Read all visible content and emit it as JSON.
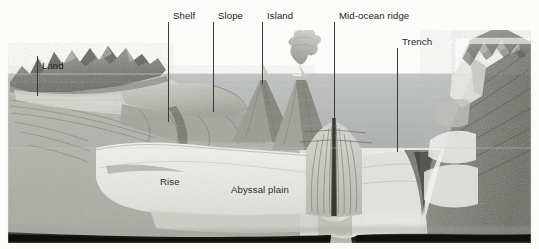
{
  "diagram": {
    "type": "geology-cross-section",
    "palette": {
      "background": "#fbfbfa",
      "water_upper": "#b9bcbb",
      "water_lower": "#e9eae6",
      "crust_light": "#cfd0cb",
      "crust_mid": "#a9aaa4",
      "crust_dark": "#6e6f69",
      "mantle_band": "#14130f",
      "label_text": "#232323",
      "leader_line": "#3a3a3a"
    },
    "callouts": [
      {
        "id": "land",
        "label": "Land",
        "label_x": 40,
        "label_y": 60,
        "line_x": 37,
        "line_y1": 56,
        "line_y2": 96
      },
      {
        "id": "shelf",
        "label": "Shelf",
        "label_x": 170,
        "label_y": 10,
        "line_x": 168,
        "line_y1": 22,
        "line_y2": 122
      },
      {
        "id": "slope",
        "label": "Slope",
        "label_x": 215,
        "label_y": 10,
        "line_x": 213,
        "line_y1": 22,
        "line_y2": 112
      },
      {
        "id": "island",
        "label": "Island",
        "label_x": 264,
        "label_y": 10,
        "line_x": 262,
        "line_y1": 22,
        "line_y2": 84
      },
      {
        "id": "mid-ocean-ridge",
        "label": "Mid-ocean ridge",
        "label_x": 336,
        "label_y": 10,
        "line_x": 334,
        "line_y1": 22,
        "line_y2": 134
      },
      {
        "id": "trench",
        "label": "Trench",
        "label_x": 399,
        "label_y": 36,
        "line_x": 397,
        "line_y1": 48,
        "line_y2": 152
      }
    ],
    "inline_labels": [
      {
        "id": "rise",
        "label": "Rise",
        "x": 160,
        "y": 176
      },
      {
        "id": "abyssal-plain",
        "label": "Abyssal plain",
        "x": 231,
        "y": 184
      }
    ],
    "features": [
      "continental mountains on the left",
      "continental shelf",
      "continental slope",
      "continental rise",
      "abyssal plain",
      "volcanic island with peak above sea level",
      "active volcano with ash plume",
      "mid-ocean ridge with rift valley",
      "deep ocean trench on the right",
      "subducting slab and layered crust",
      "dark mantle band at base of block"
    ],
    "sea_level_y": 74
  }
}
